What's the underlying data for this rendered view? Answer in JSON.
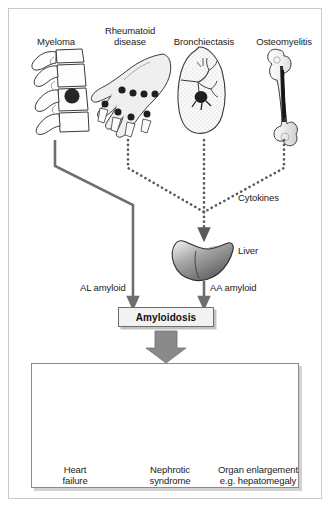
{
  "figure": {
    "border_color": "#c9c9c9",
    "ink_color": "#1b1b1b",
    "arrow_color": "#6e6e6e",
    "dotted_color": "#5a5a5a"
  },
  "causes": [
    {
      "id": "myeloma",
      "label": "Myeloma",
      "icon": "vertebrae-icon"
    },
    {
      "id": "rheumatoid",
      "label": "Rheumatoid\ndisease",
      "icon": "hand-icon"
    },
    {
      "id": "bronchiectasis",
      "label": "Bronchiectasis",
      "icon": "lung-icon"
    },
    {
      "id": "osteomyelitis",
      "label": "Osteomyelitis",
      "icon": "femur-bone-icon"
    }
  ],
  "pathways": {
    "cytokines_label": "Cytokines",
    "liver_label": "Liver",
    "al_label": "AL amyloid",
    "aa_label": "AA amyloid"
  },
  "central": {
    "box_label": "Amyloidosis"
  },
  "outcomes": [
    {
      "id": "heart",
      "label": "Heart\nfailure",
      "icon": "heart-icon"
    },
    {
      "id": "kidney",
      "label": "Nephrotic\nsyndrome",
      "icon": "kidney-icon"
    },
    {
      "id": "liver",
      "label": "Organ enlargement\ne.g. hepatomegaly",
      "icon": "liver-icon"
    }
  ]
}
